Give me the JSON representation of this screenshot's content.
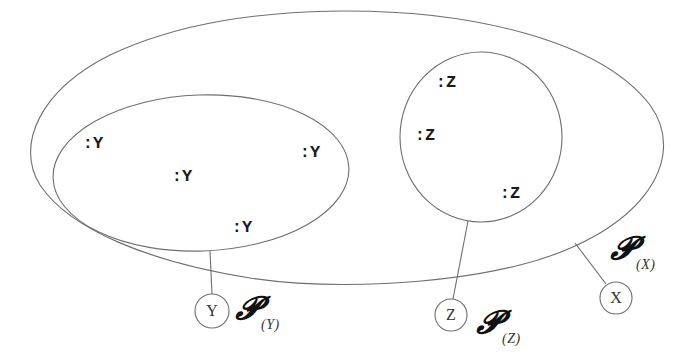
{
  "diagram": {
    "outer_set": {
      "name": "X",
      "node_label": "X",
      "power_symbol": "𝓟",
      "power_subscript": "(X)"
    },
    "subset_y": {
      "name": "Y",
      "node_label": "Y",
      "power_symbol": "𝓟",
      "power_subscript": "(Y)",
      "instances": [
        ":Y",
        ":Y",
        ":Y",
        ":Y"
      ]
    },
    "subset_z": {
      "name": "Z",
      "node_label": "Z",
      "power_symbol": "𝓟",
      "power_subscript": "(Z)",
      "instances": [
        ":Z",
        ":Z",
        ":Z"
      ]
    },
    "colors": {
      "stroke": "#6e6e6e",
      "text": "#1a1a1a",
      "background": "#ffffff"
    }
  }
}
